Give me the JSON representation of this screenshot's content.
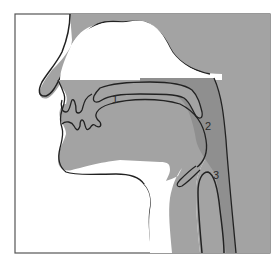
{
  "diagram": {
    "type": "sagittal-section-vocal-tract",
    "colors": {
      "background": "#ffffff",
      "tissue": "#a3a3a3",
      "airway_dark": "#8a8a8a",
      "outline": "#222222",
      "frame": "#555555"
    },
    "labels": [
      {
        "id": "1",
        "text": "1",
        "x": 112,
        "y": 103
      },
      {
        "id": "2",
        "text": "2",
        "x": 205,
        "y": 130
      },
      {
        "id": "3",
        "text": "3",
        "x": 213,
        "y": 179
      }
    ]
  }
}
